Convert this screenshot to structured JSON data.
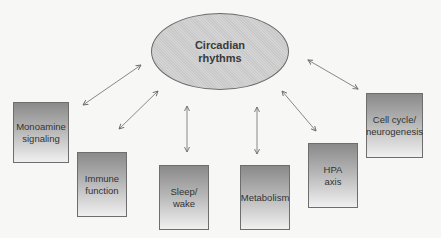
{
  "diagram": {
    "center": {
      "label": "Circadian\nrhythms"
    },
    "nodes": [
      {
        "id": "monoamine",
        "label": "Monoamine\nsignaling",
        "x": 13,
        "y": 102,
        "w": 56,
        "h": 61
      },
      {
        "id": "immune",
        "label": "Immune\nfunction",
        "x": 77,
        "y": 152,
        "w": 50,
        "h": 65
      },
      {
        "id": "sleep",
        "label": "Sleep/\nwake",
        "x": 159,
        "y": 165,
        "w": 50,
        "h": 65
      },
      {
        "id": "metabolism",
        "label": "Metabolism",
        "x": 240,
        "y": 165,
        "w": 50,
        "h": 65
      },
      {
        "id": "hpa",
        "label": "HPA\naxis",
        "x": 308,
        "y": 143,
        "w": 50,
        "h": 65
      },
      {
        "id": "cellcycle",
        "label": "Cell cycle/\nneurogenesis",
        "x": 366,
        "y": 93,
        "w": 57,
        "h": 65
      }
    ],
    "edges": [
      {
        "from": "circadian",
        "to": "monoamine",
        "type": "bidirectional"
      },
      {
        "from": "circadian",
        "to": "immune",
        "type": "bidirectional"
      },
      {
        "from": "circadian",
        "to": "sleep",
        "type": "bidirectional"
      },
      {
        "from": "circadian",
        "to": "metabolism",
        "type": "bidirectional"
      },
      {
        "from": "circadian",
        "to": "hpa",
        "type": "bidirectional"
      },
      {
        "from": "circadian",
        "to": "cellcycle",
        "type": "bidirectional"
      }
    ],
    "colors": {
      "ellipse_fill": "#cfcfcf",
      "box_gradient_top": "#8a8a8a",
      "box_gradient_bottom": "#f0f0f0",
      "border": "#6e6e6e",
      "arrow": "#6a6a6a"
    }
  }
}
